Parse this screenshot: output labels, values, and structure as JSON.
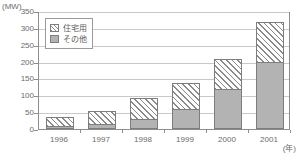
{
  "chart_data": {
    "type": "bar",
    "stacked": true,
    "title": "",
    "xlabel": "(年)",
    "ylabel": "(MW)",
    "categories": [
      "1996",
      "1997",
      "1998",
      "1999",
      "2000",
      "2001"
    ],
    "series": [
      {
        "name": "その他",
        "values": [
          8,
          15,
          30,
          60,
          120,
          200
        ],
        "style": "solid-gray",
        "color": "#b3b3b3"
      },
      {
        "name": "住宅用",
        "values": [
          32,
          40,
          65,
          80,
          90,
          120
        ],
        "style": "diagonal-hatch",
        "color": "#ffffff"
      }
    ],
    "totals": [
      40,
      55,
      95,
      140,
      210,
      320
    ],
    "ylim": [
      0,
      350
    ],
    "yticks": [
      0,
      50,
      100,
      150,
      200,
      250,
      300,
      350
    ],
    "grid": true,
    "legend_position": "top-left-inside"
  },
  "axes": {
    "y_unit": "(MW)",
    "x_unit": "(年)",
    "y_tick_labels": [
      "350",
      "300",
      "250",
      "200",
      "150",
      "100",
      "50",
      "0"
    ],
    "x_tick_labels": [
      "1996",
      "1997",
      "1998",
      "1999",
      "2000",
      "2001"
    ]
  },
  "legend": {
    "items": [
      {
        "label": "住宅用",
        "swatch": "hatched-swatch"
      },
      {
        "label": "その他",
        "swatch": "gray-swatch"
      }
    ]
  },
  "colors": {
    "other_fill": "#b3b3b3",
    "hatch_line": "#8a8a8a",
    "bar_border": "#7d7d7d",
    "gridline": "#c9c9c9",
    "frame": "#8d8d8d",
    "text": "#5a5a5a"
  }
}
